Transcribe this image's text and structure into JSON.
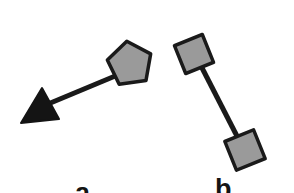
{
  "figure": {
    "background_color": "#ffffff",
    "width": 294,
    "height": 193,
    "stroke_color": "#1a1a1a",
    "node_fill_color": "#9a9a9a",
    "arrow_fill_color": "#141414",
    "label_color": "#141414"
  },
  "panels": [
    {
      "id": "a",
      "label": "a",
      "label_x": 75,
      "label_y": 180,
      "description": "pentagon node linked by a straight edge to a solid black arrowhead",
      "elements": [
        {
          "name": "edge-pentagon-arrow",
          "type": "line",
          "x1": 120,
          "y1": 74,
          "x2": 48,
          "y2": 104,
          "stroke_width": 5,
          "color": "#1a1a1a"
        },
        {
          "name": "pentagon-node",
          "type": "pentagon",
          "center_x": 130,
          "center_y": 64,
          "radius": 22,
          "rotation_deg": -8,
          "fill": "#9a9a9a",
          "stroke": "#1a1a1a",
          "stroke_width": 3.5
        },
        {
          "name": "arrowhead-node",
          "type": "triangle",
          "points": "42,88 59,119 21,123",
          "fill": "#141414",
          "stroke": "#141414",
          "stroke_width": 2
        }
      ]
    },
    {
      "id": "b",
      "label": "b",
      "label_x": 215,
      "label_y": 176,
      "description": "two gray square nodes linked by a straight edge",
      "elements": [
        {
          "name": "edge-square-square",
          "type": "line",
          "x1": 199,
          "y1": 62,
          "x2": 240,
          "y2": 142,
          "stroke_width": 5,
          "color": "#1a1a1a"
        },
        {
          "name": "square-node-top",
          "type": "square",
          "center_x": 194,
          "center_y": 54,
          "size": 30,
          "rotation_deg": -22,
          "fill": "#9a9a9a",
          "stroke": "#1a1a1a",
          "stroke_width": 3.5
        },
        {
          "name": "square-node-bottom",
          "type": "square",
          "center_x": 245,
          "center_y": 150,
          "size": 31,
          "rotation_deg": -22,
          "fill": "#9a9a9a",
          "stroke": "#1a1a1a",
          "stroke_width": 3.5
        }
      ]
    }
  ]
}
